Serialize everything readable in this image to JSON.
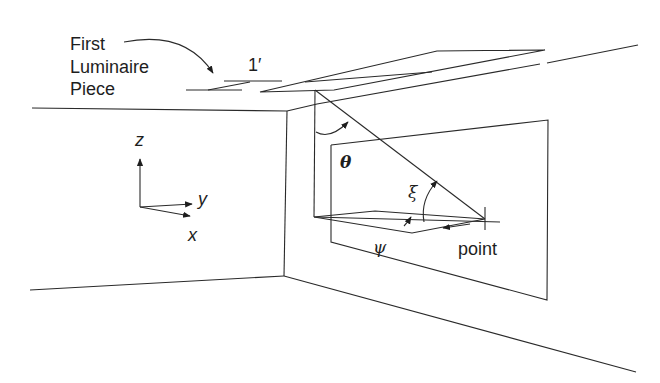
{
  "diagram": {
    "type": "room-geometry-luminaire-angles",
    "colors": {
      "line": "#2a2a2a",
      "text": "#1e1e1e",
      "background": "#ffffff"
    }
  },
  "labels": {
    "luminaire_line1": "First",
    "luminaire_line2": "Luminaire",
    "luminaire_line3": "Piece",
    "length": "1′",
    "axis_z": "z",
    "axis_y": "y",
    "axis_x": "x",
    "theta": "θ",
    "xi": "ξ",
    "psi": "ψ",
    "point": "point"
  }
}
